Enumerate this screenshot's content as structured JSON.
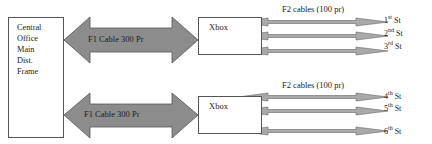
{
  "central_office": {
    "lines": [
      "Central",
      "Office",
      "Main",
      "Dist.",
      "Frame"
    ]
  },
  "feeders": [
    {
      "f1_label": "F1 Cable 300 Pr",
      "xbox_label": "Xbox",
      "f2_label": "F2 cables (100 pr)",
      "streets": [
        {
          "num": "1",
          "suffix": "st",
          "name": "St"
        },
        {
          "num": "2",
          "suffix": "nd",
          "name": "St"
        },
        {
          "num": "3",
          "suffix": "rd",
          "name": "St"
        }
      ]
    },
    {
      "f1_label": "F1 Cable 300 Pr",
      "xbox_label": "Xbox",
      "f2_label": "F2 cables (100 pr)",
      "streets": [
        {
          "num": "4",
          "suffix": "th",
          "name": "St"
        },
        {
          "num": "5",
          "suffix": "th",
          "name": "St"
        },
        {
          "num": "6",
          "suffix": "th",
          "name": "St"
        }
      ]
    }
  ],
  "colors": {
    "arrow_fill": "#8c8c8c",
    "arrow_stroke": "#555555",
    "f2_fill": "#a9a9a9",
    "box_border": "#555555"
  }
}
